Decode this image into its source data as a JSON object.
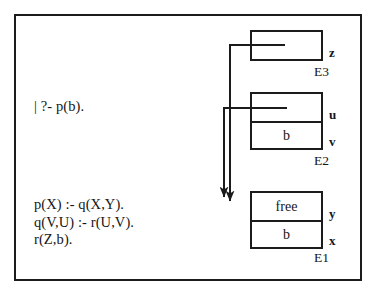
{
  "figure": {
    "background_color": "#ffffff",
    "line_color": "#1b1b1b"
  },
  "program": {
    "query": "| ?- p(b).",
    "clauses": "p(X) :- q(X,Y).\nq(V,U) :- r(U,V).\nr(Z,b)."
  },
  "environments": [
    {
      "name": "E3",
      "cells": [
        {
          "value": "",
          "slot": "z",
          "has_pointer": true
        }
      ]
    },
    {
      "name": "E2",
      "cells": [
        {
          "value": "",
          "slot": "u",
          "has_pointer": true
        },
        {
          "value": "b",
          "slot": "v",
          "has_pointer": false
        }
      ]
    },
    {
      "name": "E1",
      "cells": [
        {
          "value": "free",
          "slot": "y",
          "has_pointer": false
        },
        {
          "value": "b",
          "slot": "x",
          "has_pointer": false
        }
      ]
    }
  ]
}
